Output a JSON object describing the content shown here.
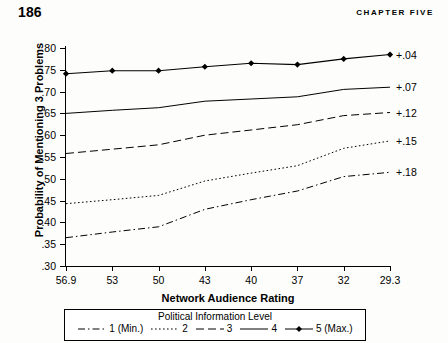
{
  "runhead": {
    "page_number": "186",
    "chapter": "CHAPTER FIVE"
  },
  "chart_data": {
    "type": "line",
    "title": "",
    "xlabel": "Network Audience Rating",
    "ylabel": "Probability of Mentioning 3 Problems",
    "categories": [
      "56.9",
      "53",
      "50",
      "43",
      "40",
      "37",
      "32",
      "29.3"
    ],
    "ylim": [
      0.3,
      0.8
    ],
    "yticks": [
      ".80",
      ".75",
      ".70",
      ".65",
      ".60",
      ".55",
      ".50",
      ".45",
      ".40",
      ".35",
      ".30"
    ],
    "ytick_values": [
      0.8,
      0.75,
      0.7,
      0.65,
      0.6,
      0.55,
      0.5,
      0.45,
      0.4,
      0.35,
      0.3
    ],
    "grid": false,
    "legend_position": "below",
    "legend_title": "Political Information Level",
    "series": [
      {
        "name": "1 (Min.)",
        "style": "dash-dot",
        "marker": "none",
        "end_label": "+.18",
        "values": [
          0.365,
          0.378,
          0.39,
          0.43,
          0.452,
          0.472,
          0.505,
          0.515
        ]
      },
      {
        "name": "2",
        "style": "dotted",
        "marker": "none",
        "end_label": "+.15",
        "values": [
          0.443,
          0.452,
          0.462,
          0.495,
          0.513,
          0.53,
          0.57,
          0.587
        ]
      },
      {
        "name": "3",
        "style": "dashed",
        "marker": "none",
        "end_label": "+.12",
        "values": [
          0.558,
          0.568,
          0.578,
          0.6,
          0.612,
          0.624,
          0.645,
          0.652
        ]
      },
      {
        "name": "4",
        "style": "solid",
        "marker": "none",
        "end_label": "+.07",
        "values": [
          0.65,
          0.657,
          0.663,
          0.678,
          0.683,
          0.688,
          0.705,
          0.71
        ]
      },
      {
        "name": "5 (Max.)",
        "style": "solid-marker",
        "marker": "diamond",
        "end_label": "+.04",
        "values": [
          0.741,
          0.748,
          0.748,
          0.757,
          0.765,
          0.762,
          0.775,
          0.785
        ]
      }
    ]
  }
}
